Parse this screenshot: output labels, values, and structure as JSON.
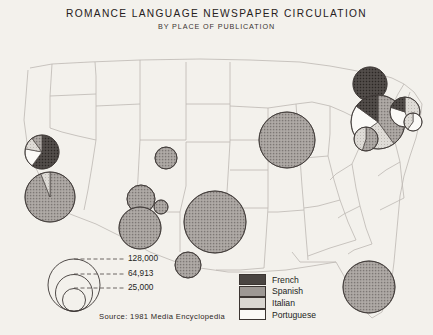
{
  "title": {
    "main": "ROMANCE LANGUAGE NEWSPAPER CIRCULATION",
    "sub": "BY PLACE OF PUBLICATION"
  },
  "source": "Source: 1981 Media Encyclopedia",
  "category_legend": {
    "items": [
      {
        "label": "French",
        "color": "#4a4542"
      },
      {
        "label": "Spanish",
        "color": "#9d9894"
      },
      {
        "label": "Italian",
        "color": "#d9d6d1"
      },
      {
        "label": "Portuguese",
        "color": "#fbfaf7"
      }
    ]
  },
  "size_legend": {
    "values": [
      "128,000",
      "64,913",
      "25,000"
    ],
    "circles": [
      {
        "value": 128000,
        "r": 26.0
      },
      {
        "value": 64913,
        "r": 18.5
      },
      {
        "value": 25000,
        "r": 11.5
      }
    ]
  },
  "chart_data": {
    "type": "pie",
    "title": "ROMANCE LANGUAGE NEWSPAPER CIRCULATION",
    "subtitle": "BY PLACE OF PUBLICATION",
    "units": "newspaper circulation (copies)",
    "symbolization": "proportional circles / pie charts by place of publication",
    "legend_position": "bottom-center",
    "grid": false,
    "categories": [
      "French",
      "Spanish",
      "Italian",
      "Portuguese"
    ],
    "category_colors": [
      "#4a4542",
      "#9d9894",
      "#d9d6d1",
      "#fbfaf7"
    ],
    "scale_breaks": [
      128000,
      64913,
      25000
    ],
    "points": [
      {
        "place": "San Francisco Bay Area",
        "cx": 42,
        "cy": 152,
        "r": 17,
        "slices": [
          {
            "cat": "French",
            "frac": 0.6
          },
          {
            "cat": "Portuguese",
            "frac": 0.18
          },
          {
            "cat": "Italian",
            "frac": 0.12
          },
          {
            "cat": "Spanish",
            "frac": 0.1
          }
        ]
      },
      {
        "place": "Los Angeles",
        "cx": 50,
        "cy": 197,
        "r": 25,
        "slices": [
          {
            "cat": "Spanish",
            "frac": 0.94
          },
          {
            "cat": "Italian",
            "frac": 0.06
          }
        ]
      },
      {
        "place": "Colorado",
        "cx": 166,
        "cy": 158,
        "r": 11,
        "slices": [
          {
            "cat": "Spanish",
            "frac": 1.0
          }
        ]
      },
      {
        "place": "Arizona / New Mexico",
        "cx": 141,
        "cy": 199,
        "r": 14,
        "slices": [
          {
            "cat": "Spanish",
            "frac": 1.0
          }
        ]
      },
      {
        "place": "Southwest small",
        "cx": 161,
        "cy": 207,
        "r": 7,
        "slices": [
          {
            "cat": "Spanish",
            "frac": 1.0
          }
        ]
      },
      {
        "place": "West Texas",
        "cx": 140,
        "cy": 228,
        "r": 21,
        "slices": [
          {
            "cat": "Spanish",
            "frac": 1.0
          }
        ]
      },
      {
        "place": "South Texas",
        "cx": 188,
        "cy": 265,
        "r": 13,
        "slices": [
          {
            "cat": "Spanish",
            "frac": 1.0
          }
        ]
      },
      {
        "place": "Texas Gulf",
        "cx": 215,
        "cy": 222,
        "r": 31,
        "slices": [
          {
            "cat": "Spanish",
            "frac": 1.0
          }
        ]
      },
      {
        "place": "Chicago",
        "cx": 287,
        "cy": 140,
        "r": 28,
        "slices": [
          {
            "cat": "Spanish",
            "frac": 1.0
          }
        ]
      },
      {
        "place": "Miami / South Florida",
        "cx": 369,
        "cy": 287,
        "r": 26,
        "slices": [
          {
            "cat": "Spanish",
            "frac": 1.0
          }
        ]
      },
      {
        "place": "Upstate New York",
        "cx": 370,
        "cy": 84,
        "r": 17,
        "slices": [
          {
            "cat": "French",
            "frac": 1.0
          }
        ]
      },
      {
        "place": "New York City",
        "cx": 378,
        "cy": 122,
        "r": 27,
        "slices": [
          {
            "cat": "Spanish",
            "frac": 0.4
          },
          {
            "cat": "Italian",
            "frac": 0.25
          },
          {
            "cat": "Portuguese",
            "frac": 0.2
          },
          {
            "cat": "French",
            "frac": 0.15
          }
        ]
      },
      {
        "place": "New England",
        "cx": 405,
        "cy": 112,
        "r": 15,
        "slices": [
          {
            "cat": "Italian",
            "frac": 0.45
          },
          {
            "cat": "Portuguese",
            "frac": 0.35
          },
          {
            "cat": "French",
            "frac": 0.2
          }
        ]
      },
      {
        "place": "Rhode Island",
        "cx": 413,
        "cy": 122,
        "r": 9,
        "slices": [
          {
            "cat": "Portuguese",
            "frac": 0.6
          },
          {
            "cat": "Italian",
            "frac": 0.4
          }
        ]
      },
      {
        "place": "New Jersey",
        "cx": 366,
        "cy": 139,
        "r": 12,
        "slices": [
          {
            "cat": "Spanish",
            "frac": 0.55
          },
          {
            "cat": "Italian",
            "frac": 0.45
          }
        ]
      }
    ]
  },
  "map_regions": {
    "outline_color": "#b9b4ae",
    "background": "#f3f1ec"
  }
}
